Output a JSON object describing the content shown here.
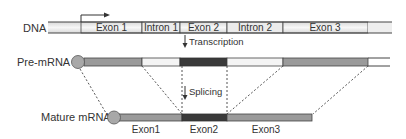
{
  "colors": {
    "exon_mid": "#9a9a9a",
    "exon_dark": "#3a3a3a",
    "intron_light": "#f0f0f0",
    "dna_fill": "#e6e6e6",
    "outline": "#444444",
    "text": "#333333",
    "cap": "#a8a8a8"
  },
  "dna": {
    "label": "DNA",
    "segments": [
      {
        "type": "flank",
        "label": ""
      },
      {
        "type": "exon",
        "label": "Exon 1"
      },
      {
        "type": "intron",
        "label": "Intron 1"
      },
      {
        "type": "exon",
        "label": "Exon 2"
      },
      {
        "type": "intron",
        "label": "Intron 2"
      },
      {
        "type": "exon",
        "label": "Exon 3"
      },
      {
        "type": "flank",
        "label": ""
      }
    ]
  },
  "steps": {
    "transcription": "Transcription",
    "splicing": "Splicing"
  },
  "pre_mrna": {
    "label": "Pre-mRNA"
  },
  "mature_mrna": {
    "label": "Mature mRNA",
    "exon_labels": [
      "Exon1",
      "Exon2",
      "Exon3"
    ]
  }
}
